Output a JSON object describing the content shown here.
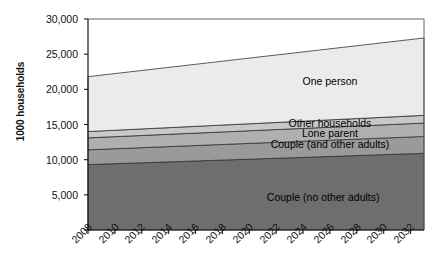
{
  "chart_data": {
    "type": "area",
    "stacked": true,
    "title": "",
    "xlabel": "",
    "ylabel": "1000 households",
    "ylim": [
      0,
      30000
    ],
    "xlim": [
      2008,
      2033
    ],
    "yticks": [
      0,
      5000,
      10000,
      15000,
      20000,
      25000,
      30000
    ],
    "ytick_labels": [
      "",
      "5,000",
      "10,000",
      "15,000",
      "20,000",
      "25,000",
      "30,000"
    ],
    "xticks": [
      2008,
      2010,
      2012,
      2014,
      2016,
      2018,
      2020,
      2022,
      2024,
      2026,
      2028,
      2030,
      2032
    ],
    "xtick_labels": [
      "2008",
      "2010",
      "2012",
      "2014",
      "2016",
      "2018",
      "2020",
      "2022",
      "2024",
      "2026",
      "2028",
      "2030",
      "2032"
    ],
    "grid": false,
    "legend_position": "inline-labels",
    "x": [
      2008,
      2033
    ],
    "series": [
      {
        "name": "Couple (no other adults)",
        "values": [
          9300,
          10900
        ],
        "color": "#6e6e6e",
        "label_x": 2025.5,
        "label_y": 4600
      },
      {
        "name": "Couple (and other adults)",
        "values": [
          2100,
          2400
        ],
        "color": "#9a9a9a",
        "label_x": 2026.0,
        "label_y": 12150
      },
      {
        "name": "Lone parent",
        "values": [
          1700,
          1900
        ],
        "color": "#b0b0b0",
        "label_x": 2026.0,
        "label_y": 13650
      },
      {
        "name": "Other households",
        "values": [
          900,
          1100
        ],
        "color": "#c8c8c8",
        "label_x": 2026.0,
        "label_y": 15100
      },
      {
        "name": "One person",
        "values": [
          7800,
          11000
        ],
        "color": "#ebebeb",
        "label_x": 2026.0,
        "label_y": 21000
      }
    ],
    "totals": [
      21800,
      27300
    ]
  },
  "plot_area": {
    "left": 88,
    "top": 19,
    "right": 424,
    "bottom": 230
  },
  "colors": {
    "axis": "#1a1a1a",
    "text": "#111111",
    "background": "#ffffff",
    "series_outline": "#333333"
  }
}
